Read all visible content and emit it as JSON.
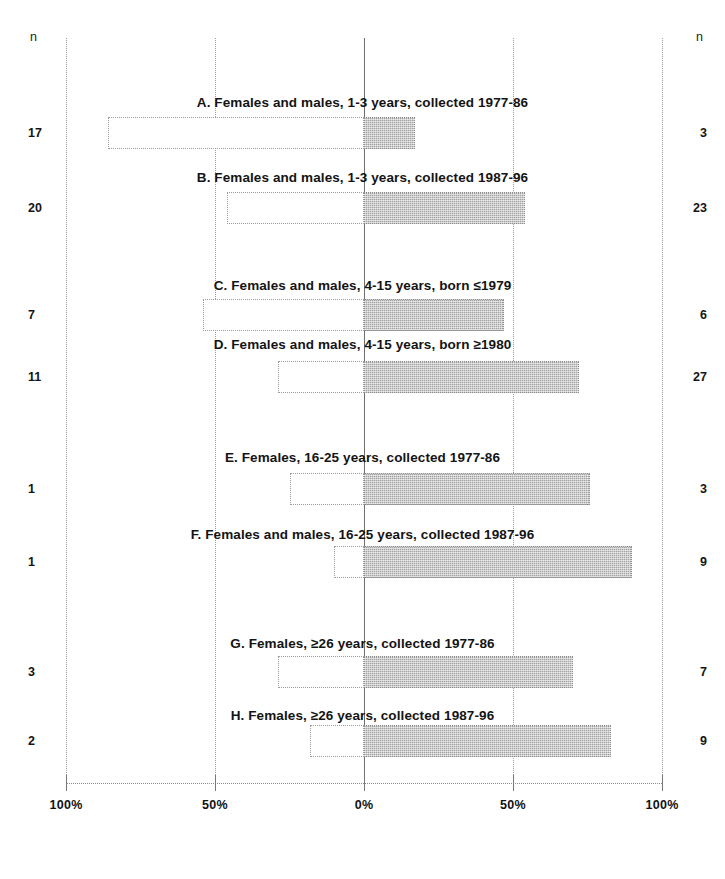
{
  "axis": {
    "left_header": "n",
    "right_header": "n",
    "tick_labels": [
      "100%",
      "50%",
      "0%",
      "50%",
      "100%"
    ],
    "tick_percent_positions": [
      -100,
      -50,
      0,
      50,
      100
    ],
    "zero_label": "0%"
  },
  "colors": {
    "bar_left_fill": "#ffffff",
    "bar_right_fill": "#a3a3a3",
    "bar_border": "#9c9c9c",
    "gridline": "#9a9a9a",
    "zero_line": "#6e6e6e",
    "text": "#151515",
    "background": "#ffffff"
  },
  "panels": [
    {
      "id": "A",
      "title": "A. Females and males, 1-3 years, collected 1977-86",
      "n_left": "17",
      "n_right": "3",
      "left_percent": 86,
      "right_percent": 17
    },
    {
      "id": "B",
      "title": "B. Females and males, 1-3 years, collected 1987-96",
      "n_left": "20",
      "n_right": "23",
      "left_percent": 46,
      "right_percent": 54
    },
    {
      "id": "C",
      "title": "C. Females and males, 4-15 years, born ≤1979",
      "n_left": "7",
      "n_right": "6",
      "left_percent": 54,
      "right_percent": 47
    },
    {
      "id": "D",
      "title": "D. Females and males, 4-15 years, born ≥1980",
      "n_left": "11",
      "n_right": "27",
      "left_percent": 29,
      "right_percent": 72
    },
    {
      "id": "E",
      "title": "E. Females, 16-25 years, collected 1977-86",
      "n_left": "1",
      "n_right": "3",
      "left_percent": 25,
      "right_percent": 76
    },
    {
      "id": "F",
      "title": "F. Females and males, 16-25 years, collected 1987-96",
      "n_left": "1",
      "n_right": "9",
      "left_percent": 10,
      "right_percent": 90
    },
    {
      "id": "G",
      "title": "G. Females, ≥26 years, collected 1977-86",
      "n_left": "3",
      "n_right": "7",
      "left_percent": 29,
      "right_percent": 70
    },
    {
      "id": "H",
      "title": "H. Females, ≥26 years, collected 1987-96",
      "n_left": "2",
      "n_right": "9",
      "left_percent": 18,
      "right_percent": 83
    }
  ],
  "chart_data": {
    "type": "bar",
    "orientation": "horizontal-diverging",
    "title": "",
    "xlabel": "",
    "ylabel": "n",
    "xlim": [
      -100,
      100
    ],
    "xticks": [
      -100,
      -50,
      0,
      50,
      100
    ],
    "xticklabels": [
      "100%",
      "50%",
      "0%",
      "50%",
      "100%"
    ],
    "grid": true,
    "legend": "none",
    "categories": [
      "A. Females and males, 1-3 years, collected 1977-86",
      "B. Females and males, 1-3 years, collected 1987-96",
      "C. Females and males, 4-15 years, born ≤1979",
      "D. Females and males, 4-15 years, born ≥1980",
      "E. Females, 16-25 years, collected 1977-86",
      "F. Females and males, 16-25 years, collected 1987-96",
      "G. Females, ≥26 years, collected 1977-86",
      "H. Females, ≥26 years, collected 1987-96"
    ],
    "series": [
      {
        "name": "left (white, negative direction)",
        "values": [
          -86,
          -46,
          -54,
          -29,
          -25,
          -10,
          -29,
          -18
        ],
        "counts": [
          17,
          20,
          7,
          11,
          1,
          1,
          3,
          2
        ]
      },
      {
        "name": "right (shaded, positive direction)",
        "values": [
          17,
          54,
          47,
          72,
          76,
          90,
          70,
          83
        ],
        "counts": [
          3,
          23,
          6,
          27,
          3,
          9,
          7,
          9
        ]
      }
    ]
  }
}
